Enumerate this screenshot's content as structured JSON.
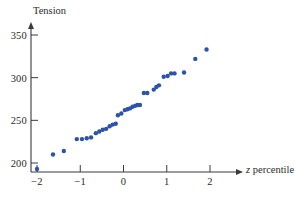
{
  "chart_data": {
    "type": "scatter",
    "title": "",
    "xlabel": "z percentile",
    "ylabel": "Tension",
    "xlim": [
      -2.35,
      2.45
    ],
    "ylim": [
      185,
      360
    ],
    "grid": false,
    "legend": null,
    "marker_color": "#2d53a8",
    "axis_color": "#3a3a3a",
    "xticks": [
      -2,
      -1,
      0,
      1,
      2
    ],
    "xticklabels": [
      "−2",
      "−1",
      "0",
      "1",
      "2"
    ],
    "yticks": [
      200,
      250,
      300,
      350
    ],
    "yticklabels": [
      "200",
      "250",
      "300",
      "350"
    ],
    "points": [
      {
        "x": -2.0,
        "y": 193
      },
      {
        "x": -1.63,
        "y": 210
      },
      {
        "x": -1.38,
        "y": 214
      },
      {
        "x": -1.08,
        "y": 228
      },
      {
        "x": -0.96,
        "y": 228
      },
      {
        "x": -0.85,
        "y": 229
      },
      {
        "x": -0.75,
        "y": 230
      },
      {
        "x": -0.64,
        "y": 235
      },
      {
        "x": -0.56,
        "y": 237
      },
      {
        "x": -0.48,
        "y": 239
      },
      {
        "x": -0.4,
        "y": 240
      },
      {
        "x": -0.32,
        "y": 243
      },
      {
        "x": -0.25,
        "y": 245
      },
      {
        "x": -0.18,
        "y": 246
      },
      {
        "x": -0.13,
        "y": 256
      },
      {
        "x": -0.05,
        "y": 258
      },
      {
        "x": 0.03,
        "y": 262
      },
      {
        "x": 0.09,
        "y": 263
      },
      {
        "x": 0.15,
        "y": 264
      },
      {
        "x": 0.21,
        "y": 266
      },
      {
        "x": 0.27,
        "y": 267
      },
      {
        "x": 0.32,
        "y": 268
      },
      {
        "x": 0.38,
        "y": 268
      },
      {
        "x": 0.47,
        "y": 282
      },
      {
        "x": 0.55,
        "y": 282
      },
      {
        "x": 0.7,
        "y": 286
      },
      {
        "x": 0.76,
        "y": 289
      },
      {
        "x": 0.82,
        "y": 291
      },
      {
        "x": 0.93,
        "y": 301
      },
      {
        "x": 1.02,
        "y": 302
      },
      {
        "x": 1.1,
        "y": 305
      },
      {
        "x": 1.18,
        "y": 305
      },
      {
        "x": 1.4,
        "y": 306
      },
      {
        "x": 1.66,
        "y": 322
      },
      {
        "x": 1.92,
        "y": 333
      }
    ]
  },
  "axes": {
    "y_title": "Tension",
    "x_title_variable": "z",
    "x_title_rest": " percentile"
  }
}
